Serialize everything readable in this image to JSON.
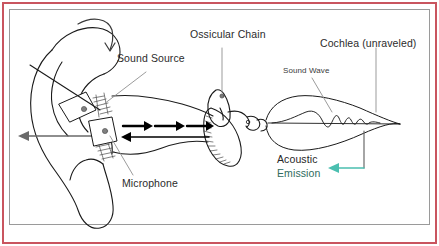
{
  "figure": {
    "title_visible": false,
    "background_color": "#ffffff",
    "outer_border_color": "#c9555f",
    "inner_border_color": "#9a9a9a",
    "line_color": "#1a1a1a",
    "leader_color": "#8a8a8a",
    "emission_arrow_color": "#4bbfb0"
  },
  "labels": {
    "sound_source": "Sound Source",
    "ossicular_chain": "Ossicular Chain",
    "cochlea": "Cochlea (unraveled)",
    "sound_wave": "Sound Wave",
    "microphone": "Microphone",
    "acoustic": "Acoustic",
    "emission": "Emission"
  },
  "annotations": {
    "canal_forward_arrows": 3,
    "canal_return_arrows": 1,
    "probe_devices": [
      "sound-source-transducer",
      "microphone-transducer"
    ],
    "pinna_curl_arrow": true
  }
}
